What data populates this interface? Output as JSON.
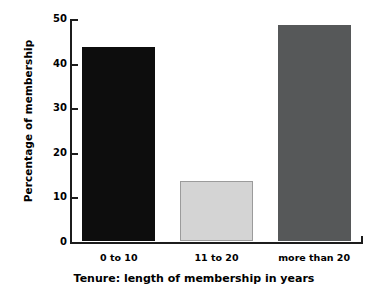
{
  "chart_data": {
    "type": "bar",
    "title": "",
    "xlabel": "Tenure: length of membership in years",
    "ylabel": "Percentage of membership",
    "categories": [
      "0 to 10",
      "11 to 20",
      "more than 20"
    ],
    "values": [
      43.5,
      13.5,
      48.5
    ],
    "series": [
      {
        "name": "Percentage of membership",
        "values": [
          43.5,
          13.5,
          48.5
        ]
      }
    ],
    "bar_colors": [
      "#0d0d0d",
      "#d4d4d4",
      "#565859"
    ],
    "bar_edge_colors": [
      "#0d0d0d",
      "#9b9b9b",
      "#565859"
    ],
    "ylim": [
      0,
      50
    ],
    "yticks": [
      0,
      10,
      20,
      30,
      40,
      50
    ],
    "ytick_labels": [
      "0",
      "10",
      "20",
      "30",
      "40",
      "50"
    ],
    "grid": false,
    "legend": "none",
    "axis_color": "#1c1c1c",
    "background": "#ffffff"
  }
}
